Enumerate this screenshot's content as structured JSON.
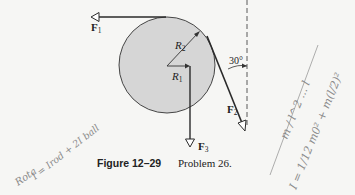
{
  "figure": {
    "caption_number": "Figure 12–29",
    "caption_text": "Problem 26.",
    "angle_label": "30°",
    "labels": {
      "R1": {
        "main": "R",
        "sub": "1"
      },
      "R2": {
        "main": "R",
        "sub": "2"
      },
      "F1": {
        "main": "F",
        "sub": "1"
      },
      "F2": {
        "main": "F",
        "sub": "2"
      },
      "F3": {
        "main": "F",
        "sub": "3"
      }
    },
    "colors": {
      "disk_fill": "#d6d6d6",
      "line": "#2a2a2a",
      "background": "#f6f6f4",
      "handwriting": "#8a8a8a"
    }
  },
  "handwriting": {
    "left_word": "Rota",
    "left_equation": "I = Irod + 2I ball",
    "right_top": "m / l^2 ... l",
    "right_equation": "I = 1/12 m0² + m(l/2)²"
  }
}
